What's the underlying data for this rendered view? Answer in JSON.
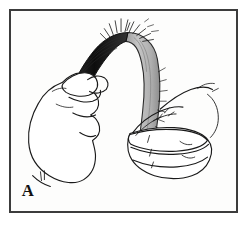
{
  "figure": {
    "panel_label": "A",
    "caption_visible": false,
    "frame": {
      "border_color": "#3c3c3c",
      "border_width_px": 2,
      "background_color": "#fdfdfc"
    },
    "page_background": "#ffffff",
    "illustration": {
      "title": "Two hands bending a flexible strip into an arch",
      "style": "pen-and-ink line drawing",
      "ink_color": "#1a1a1a",
      "subjects": [
        {
          "name": "left-hand",
          "description": "Left hand in a closed grip holding the dark end of the strip",
          "fill": "#ffffff",
          "outline": "#1a1a1a"
        },
        {
          "name": "right-hand",
          "description": "Right fist gripping the gray end of the strip, stacked finger segments visible",
          "fill": "#ffffff",
          "outline": "#1a1a1a"
        },
        {
          "name": "bent-strip",
          "description": "Flexible strip bowed into an inverted U arch between the two hands",
          "left_limb_shade": "#141414",
          "right_limb_shade": "#b9b9b9",
          "outline": "#1a1a1a",
          "bristles": "short hair-like strokes along the crest and right edge"
        }
      ]
    }
  }
}
